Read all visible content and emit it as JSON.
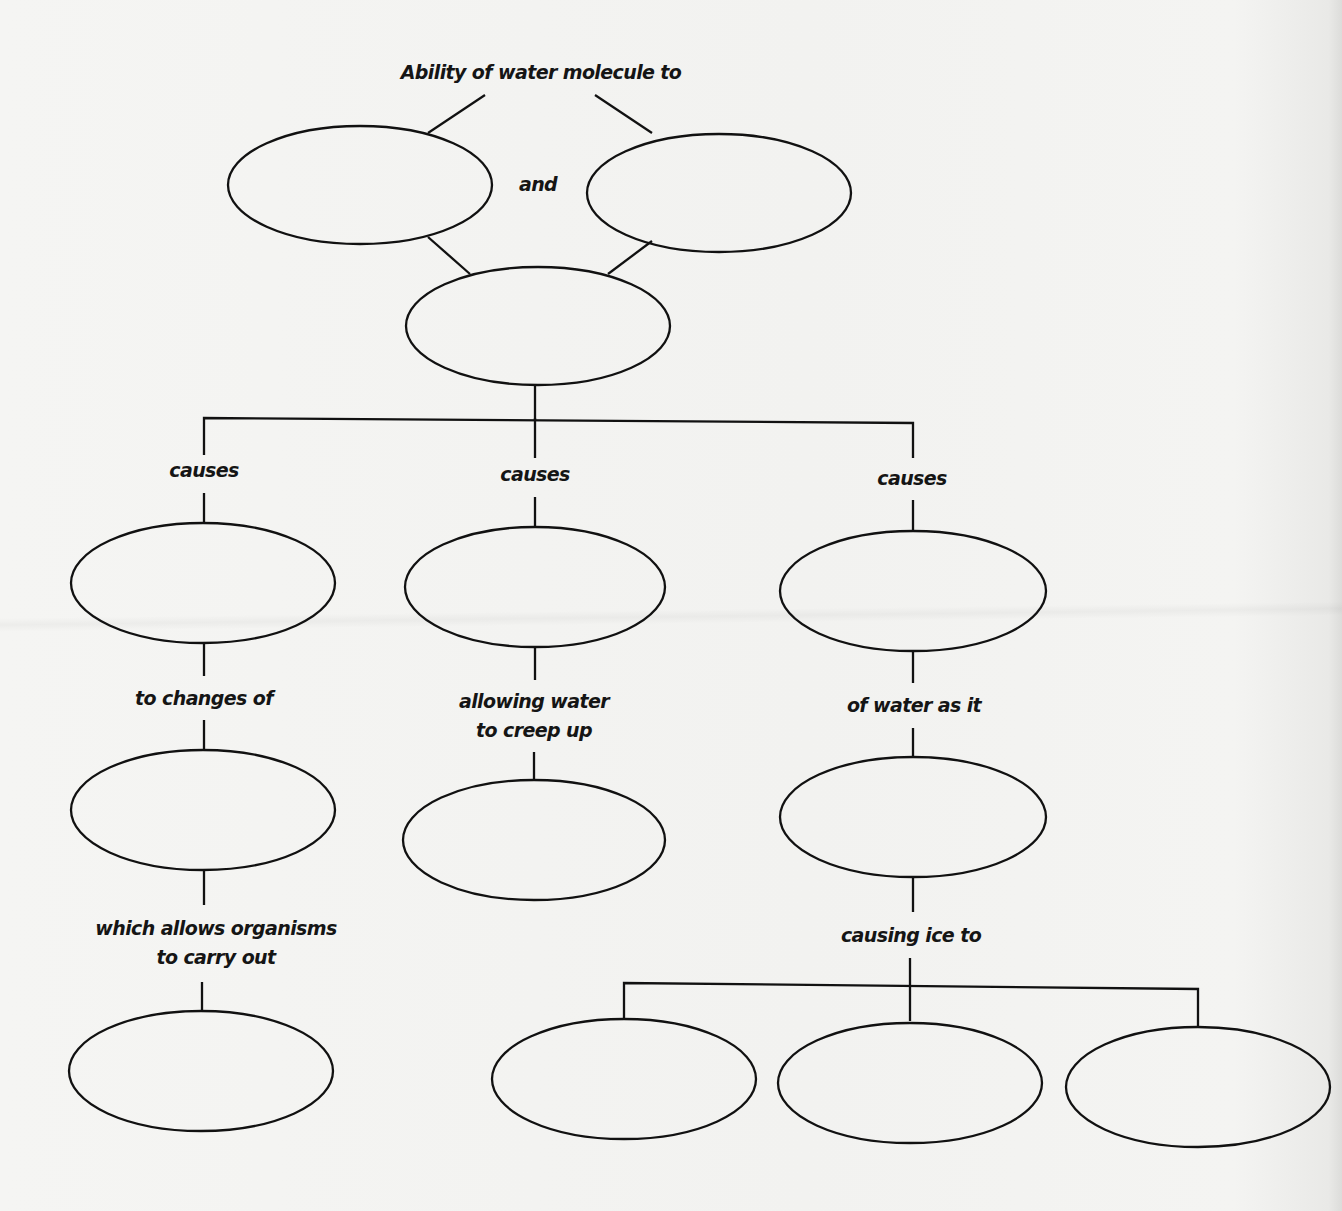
{
  "diagram": {
    "type": "concept-map",
    "title": "Ability of water molecule to",
    "colors": {
      "background": "#f3f3f1",
      "stroke": "#111111",
      "text": "#151515"
    },
    "connectors": {
      "and": "and",
      "causes_left": "causes",
      "causes_center": "causes",
      "causes_right": "causes",
      "to_changes_of": "to changes of",
      "allowing_water": [
        "allowing water",
        "to creep up"
      ],
      "of_water_as_it": "of water as it",
      "which_allows": [
        "which allows organisms",
        "to carry out"
      ],
      "causing_ice_to": "causing ice to"
    },
    "nodes": [
      {
        "id": "property-a",
        "text": ""
      },
      {
        "id": "property-b",
        "text": ""
      },
      {
        "id": "central-concept",
        "text": ""
      },
      {
        "id": "effect-left",
        "text": ""
      },
      {
        "id": "effect-center",
        "text": ""
      },
      {
        "id": "effect-right",
        "text": ""
      },
      {
        "id": "left-level-2",
        "text": ""
      },
      {
        "id": "center-level-2",
        "text": ""
      },
      {
        "id": "right-level-2",
        "text": ""
      },
      {
        "id": "left-level-3",
        "text": ""
      },
      {
        "id": "ice-result-1",
        "text": ""
      },
      {
        "id": "ice-result-2",
        "text": ""
      },
      {
        "id": "ice-result-3",
        "text": ""
      }
    ]
  }
}
